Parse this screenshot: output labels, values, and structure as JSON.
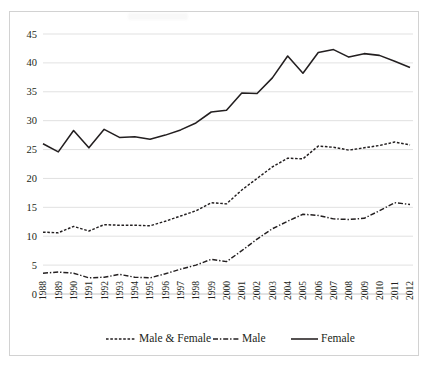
{
  "chart_data": {
    "type": "line",
    "title": "",
    "subtitle": "",
    "xlabel": "",
    "ylabel": "",
    "ylim": [
      0,
      45
    ],
    "yticks": [
      0,
      5,
      10,
      15,
      20,
      25,
      30,
      35,
      40,
      45
    ],
    "grid": true,
    "legend_position": "bottom",
    "categories": [
      "1988",
      "1989",
      "1990",
      "1991",
      "1992",
      "1993",
      "1994",
      "1995",
      "1996",
      "1997",
      "1998",
      "1999",
      "2000",
      "2001",
      "2002",
      "2003",
      "2004",
      "2005",
      "2006",
      "2007",
      "2008",
      "2009",
      "2010",
      "2011",
      "2012"
    ],
    "series": [
      {
        "name": "Male & Female",
        "style": "dotted",
        "values": [
          10.7,
          10.6,
          11.7,
          10.9,
          12.0,
          11.9,
          11.9,
          11.8,
          12.6,
          13.5,
          14.4,
          15.8,
          15.6,
          18.0,
          20.0,
          22.0,
          23.5,
          23.4,
          25.6,
          25.4,
          24.9,
          25.3,
          25.7,
          26.3,
          25.8
        ]
      },
      {
        "name": "Male",
        "style": "dash-dot",
        "values": [
          3.6,
          3.8,
          3.6,
          2.8,
          2.9,
          3.4,
          2.9,
          2.8,
          3.5,
          4.3,
          5.0,
          6.0,
          5.6,
          7.5,
          9.5,
          11.3,
          12.6,
          13.8,
          13.6,
          13.0,
          12.9,
          13.1,
          14.4,
          15.8,
          15.5
        ]
      },
      {
        "name": "Female",
        "style": "solid",
        "values": [
          26.0,
          24.6,
          28.3,
          25.3,
          28.5,
          27.1,
          27.2,
          26.8,
          27.5,
          28.4,
          29.6,
          31.5,
          31.8,
          34.8,
          34.7,
          37.4,
          41.2,
          38.2,
          41.8,
          42.3,
          41.0,
          41.6,
          41.3,
          40.3,
          39.2
        ]
      }
    ]
  },
  "legend": {
    "items": [
      {
        "label": "Male & Female",
        "style": "dotted"
      },
      {
        "label": "Male",
        "style": "dash-dot"
      },
      {
        "label": "Female",
        "style": "solid"
      }
    ]
  }
}
